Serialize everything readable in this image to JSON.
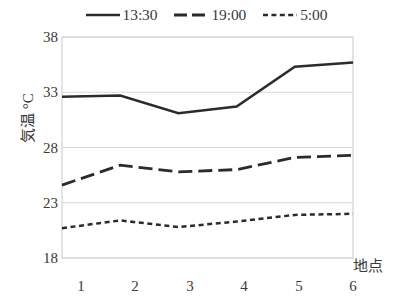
{
  "chart_data": {
    "type": "line",
    "title": "",
    "subtitle": "",
    "xlabel": "地点",
    "ylabel": "気温 °C",
    "categories": [
      "1",
      "2",
      "3",
      "4",
      "5",
      "6"
    ],
    "x": [
      1,
      2,
      3,
      4,
      5,
      6
    ],
    "xlim": [
      1,
      6
    ],
    "ylim": [
      18,
      38
    ],
    "yticks": [
      18,
      23,
      28,
      33,
      38
    ],
    "ytick_labels": [
      "18",
      "23",
      "28",
      "33",
      "38"
    ],
    "xtick_labels": [
      "1",
      "2",
      "3",
      "4",
      "5",
      "6"
    ],
    "grid": "horizontal",
    "legend_position": "top-center",
    "series": [
      {
        "name": "13:30",
        "style": "solid",
        "color": "#2b2b2b",
        "values": [
          32.6,
          32.7,
          31.1,
          31.7,
          35.3,
          35.7
        ]
      },
      {
        "name": "19:00",
        "style": "dashed",
        "color": "#2b2b2b",
        "values": [
          24.6,
          26.4,
          25.8,
          26.0,
          27.1,
          27.3
        ]
      },
      {
        "name": "5:00",
        "style": "dotted",
        "color": "#2b2b2b",
        "values": [
          20.7,
          21.4,
          20.8,
          21.3,
          21.9,
          22.0
        ]
      }
    ],
    "annotations": []
  },
  "legend": {
    "entries": [
      {
        "label": "13:30",
        "style": "solid"
      },
      {
        "label": "19:00",
        "style": "dashed"
      },
      {
        "label": "5:00",
        "style": "dotted"
      }
    ]
  },
  "axes": {
    "y_label": "気温 °C",
    "x_label": "地点",
    "y_ticks": [
      "38",
      "33",
      "28",
      "23",
      "18"
    ],
    "x_ticks": [
      "1",
      "2",
      "3",
      "4",
      "5",
      "6"
    ]
  },
  "colors": {
    "line": "#2b2b2b",
    "grid": "#d9d9d9",
    "frame": "#c9c9c9",
    "text": "#3a3a3a",
    "background": "#ffffff"
  }
}
